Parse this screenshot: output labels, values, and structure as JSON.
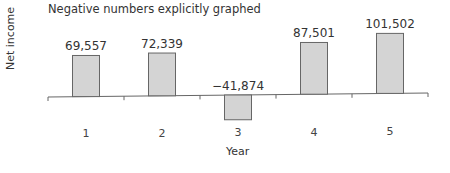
{
  "chart_data": {
    "type": "bar",
    "title": "Negative numbers explicitly graphed",
    "xlabel": "Year",
    "ylabel": "Net income",
    "categories": [
      "1",
      "2",
      "3",
      "4",
      "5"
    ],
    "values": [
      69557,
      72339,
      -41874,
      87501,
      101502
    ],
    "value_labels": [
      "69,557",
      "72,339",
      "−41,874",
      "87,501",
      "101,502"
    ],
    "grid": false,
    "legend": null,
    "bar_color": "#d4d4d4",
    "bar_edge_color": "#666666"
  }
}
